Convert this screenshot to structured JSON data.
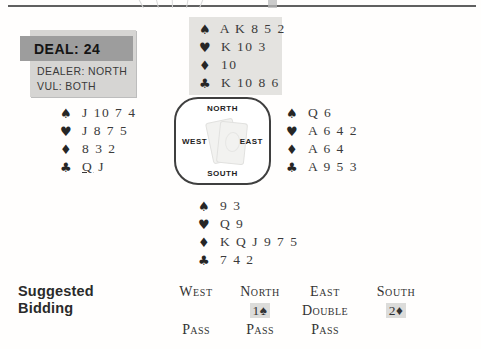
{
  "deal_info": {
    "deal_label": "DEAL: 24",
    "dealer_label": "DEALER: NORTH",
    "vul_label": "VUL: BOTH"
  },
  "suits": {
    "spade": "♠",
    "heart": "♥",
    "diamond": "♦",
    "club": "♣"
  },
  "hands": {
    "north": {
      "spades": "A K 8 5 2",
      "hearts": "K 10 3",
      "diamonds": "10",
      "clubs": "K 10 8 6"
    },
    "west": {
      "spades": "J 10 7 4",
      "hearts": "J 8 7 5",
      "diamonds": "8 3 2",
      "clubs": "Q J"
    },
    "east": {
      "spades": "Q 6",
      "hearts": "A 6 4 2",
      "diamonds": "A 6 4",
      "clubs": "A 9 5 3"
    },
    "south": {
      "spades": "9 3",
      "hearts": "Q 9",
      "diamonds": "K Q J 9 7 5",
      "clubs": "7 4 2"
    }
  },
  "compass": {
    "north": "NORTH",
    "west": "WEST",
    "east": "EAST",
    "south": "SOUTH"
  },
  "bidding": {
    "title_line1": "Suggested",
    "title_line2": "Bidding",
    "columns": [
      "West",
      "North",
      "East",
      "South"
    ],
    "rows": [
      [
        "",
        "1♠",
        "Double",
        "2♦"
      ],
      [
        "Pass",
        "Pass",
        "Pass",
        ""
      ]
    ],
    "highlighted_calls": [
      "1♠",
      "2♦"
    ],
    "opening_lead": "Q of clubs (West, underlined)"
  },
  "colors": {
    "ink": "#333333",
    "deal_bar_gray": "#9d9d9d",
    "deal_box_gray": "#d6d5d3",
    "north_hand_bg": "#e4e3e0",
    "bid_highlight": "#dcdcda",
    "top_rule": "#606060"
  }
}
